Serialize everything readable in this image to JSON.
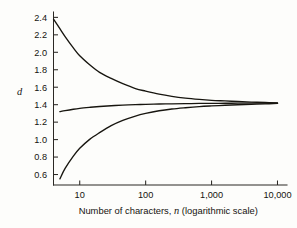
{
  "figure": {
    "background_color": "#fdfdfb",
    "ink_color": "#17150f"
  },
  "chart_data": {
    "type": "line",
    "title": "",
    "subtitle": "",
    "xlabel": "Number of characters, n (logarithmic scale)",
    "xlabel_plain": "Number of characters,",
    "xlabel_italic": "n",
    "xlabel_tail": "(logarithmic scale)",
    "ylabel": "d",
    "xscale": "log",
    "yscale": "linear",
    "xlim": [
      4,
      13000
    ],
    "ylim": [
      0.48,
      2.45
    ],
    "grid": false,
    "legend": "none",
    "frame": "left-and-bottom-spines-only",
    "x_ticks": [
      10,
      100,
      1000,
      10000
    ],
    "x_tick_labels": [
      "10",
      "100",
      "1,000",
      "10,000"
    ],
    "y_ticks": [
      0.6,
      0.8,
      1.0,
      1.2,
      1.4,
      1.6,
      1.8,
      2.0,
      2.2,
      2.4
    ],
    "y_tick_labels": [
      "0.6",
      "0.8",
      "1.0",
      "1.2",
      "1.4",
      "1.6",
      "1.8",
      "2.0",
      "2.2",
      "2.4"
    ],
    "asymptote": 1.41,
    "series": [
      {
        "name": "upper-bound-curve",
        "x": [
          4,
          5,
          6,
          8,
          10,
          14,
          20,
          30,
          45,
          70,
          100,
          160,
          250,
          400,
          650,
          1000,
          1600,
          2500,
          4000,
          6500,
          10000
        ],
        "values": [
          2.38,
          2.27,
          2.18,
          2.05,
          1.96,
          1.86,
          1.77,
          1.7,
          1.64,
          1.585,
          1.555,
          1.52,
          1.495,
          1.475,
          1.46,
          1.45,
          1.443,
          1.436,
          1.43,
          1.425,
          1.418
        ]
      },
      {
        "name": "mean-curve",
        "x": [
          5,
          6,
          8,
          10,
          14,
          20,
          30,
          45,
          70,
          100,
          160,
          250,
          400,
          650,
          1000,
          1600,
          2500,
          4000,
          6500,
          10000
        ],
        "values": [
          1.32,
          1.332,
          1.348,
          1.358,
          1.369,
          1.379,
          1.388,
          1.395,
          1.4,
          1.404,
          1.408,
          1.41,
          1.412,
          1.414,
          1.415,
          1.416,
          1.417,
          1.418,
          1.419,
          1.42
        ]
      },
      {
        "name": "lower-bound-curve",
        "x": [
          5,
          6,
          8,
          10,
          14,
          20,
          30,
          45,
          70,
          100,
          160,
          250,
          400,
          650,
          1000,
          1600,
          2500,
          4000,
          6500,
          10000
        ],
        "values": [
          0.55,
          0.67,
          0.81,
          0.9,
          1.0,
          1.08,
          1.16,
          1.22,
          1.27,
          1.3,
          1.33,
          1.35,
          1.365,
          1.378,
          1.386,
          1.393,
          1.399,
          1.404,
          1.409,
          1.414
        ]
      }
    ]
  }
}
